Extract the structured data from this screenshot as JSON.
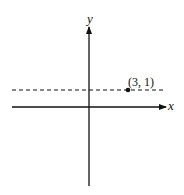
{
  "diagram": {
    "type": "coordinate-plane",
    "axes": {
      "x_label": "x",
      "y_label": "y"
    },
    "line": {
      "style": "dashed",
      "orientation": "horizontal",
      "equation_hint": "y = 1"
    },
    "point": {
      "label": "(3, 1)",
      "x": 3,
      "y": 1
    },
    "colors": {
      "stroke": "#111111",
      "background": "#ffffff"
    }
  }
}
